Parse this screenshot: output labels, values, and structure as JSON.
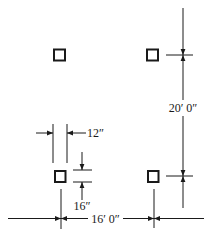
{
  "diagram": {
    "type": "column-layout-plan",
    "colors": {
      "ink": "#1a1a1a",
      "background": "#ffffff"
    },
    "columns": [
      {
        "id": "top-left"
      },
      {
        "id": "top-right"
      },
      {
        "id": "bottom-left"
      },
      {
        "id": "bottom-right"
      }
    ],
    "dimensions": {
      "column_width": "12″",
      "column_depth": "16″",
      "bay_spacing_horizontal": "16′ 0″",
      "bay_spacing_vertical": "20′ 0″"
    }
  }
}
